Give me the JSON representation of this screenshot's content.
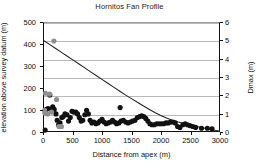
{
  "chart_data": {
    "type": "scatter",
    "title": "Hornitos Fan Profile",
    "xlabel": "Distance from apex (m)",
    "ylabel": "elevation above survey datum (m)",
    "y2label": "Dmax (m)",
    "xlim": [
      0,
      3000
    ],
    "ylim": [
      0,
      500
    ],
    "y2lim": [
      0,
      6
    ],
    "grid": true,
    "legend": "none",
    "xticks": [
      0,
      500,
      1000,
      1500,
      2000,
      2500,
      3000
    ],
    "yticks": [
      0,
      100,
      200,
      300,
      400,
      500
    ],
    "y2ticks": [
      0,
      1,
      2,
      3,
      4,
      5,
      6
    ],
    "series": [
      {
        "name": "fan surface profile",
        "type": "line",
        "axis": "left",
        "color": "#222222",
        "points": [
          [
            0,
            418
          ],
          [
            100,
            400
          ],
          [
            200,
            382
          ],
          [
            300,
            364
          ],
          [
            400,
            346
          ],
          [
            500,
            328
          ],
          [
            600,
            310
          ],
          [
            700,
            292
          ],
          [
            800,
            274
          ],
          [
            900,
            256
          ],
          [
            1000,
            238
          ],
          [
            1100,
            220
          ],
          [
            1200,
            202
          ],
          [
            1300,
            184
          ],
          [
            1400,
            166
          ],
          [
            1500,
            150
          ],
          [
            1600,
            133
          ],
          [
            1700,
            117
          ],
          [
            1800,
            101
          ],
          [
            1900,
            86
          ],
          [
            2000,
            72
          ],
          [
            2100,
            60
          ],
          [
            2200,
            50
          ],
          [
            2300,
            42
          ],
          [
            2400,
            35
          ],
          [
            2500,
            28
          ],
          [
            2600,
            22
          ],
          [
            2700,
            16
          ],
          [
            2800,
            10
          ],
          [
            2900,
            5
          ],
          [
            3000,
            0
          ]
        ]
      },
      {
        "name": "Dmax dark points",
        "type": "scatter",
        "axis": "right",
        "color": "#111111",
        "marker": "filled-circle",
        "points": [
          [
            20,
            0.05
          ],
          [
            40,
            1.2
          ],
          [
            70,
            1.25
          ],
          [
            100,
            2.0
          ],
          [
            130,
            1.2
          ],
          [
            150,
            1.35
          ],
          [
            175,
            1.2
          ],
          [
            205,
            0.95
          ],
          [
            225,
            0.6
          ],
          [
            250,
            0.35
          ],
          [
            275,
            0.45
          ],
          [
            305,
            0.75
          ],
          [
            330,
            0.8
          ],
          [
            360,
            0.95
          ],
          [
            395,
            0.9
          ],
          [
            420,
            0.55
          ],
          [
            450,
            0.75
          ],
          [
            480,
            1.1
          ],
          [
            510,
            1.05
          ],
          [
            545,
            1.05
          ],
          [
            575,
            0.95
          ],
          [
            605,
            0.75
          ],
          [
            635,
            0.55
          ],
          [
            665,
            0.6
          ],
          [
            700,
            0.9
          ],
          [
            730,
            1.15
          ],
          [
            760,
            0.95
          ],
          [
            790,
            0.6
          ],
          [
            820,
            0.45
          ],
          [
            855,
            0.5
          ],
          [
            890,
            0.4
          ],
          [
            925,
            0.45
          ],
          [
            960,
            0.55
          ],
          [
            995,
            0.65
          ],
          [
            1030,
            0.5
          ],
          [
            1065,
            0.4
          ],
          [
            1100,
            0.45
          ],
          [
            1140,
            0.5
          ],
          [
            1175,
            0.6
          ],
          [
            1210,
            0.5
          ],
          [
            1245,
            0.4
          ],
          [
            1285,
            0.45
          ],
          [
            1305,
            1.3
          ],
          [
            1320,
            0.55
          ],
          [
            1360,
            0.6
          ],
          [
            1400,
            0.5
          ],
          [
            1440,
            0.45
          ],
          [
            1480,
            0.5
          ],
          [
            1520,
            0.55
          ],
          [
            1560,
            0.6
          ],
          [
            1600,
            0.75
          ],
          [
            1640,
            0.8
          ],
          [
            1675,
            0.85
          ],
          [
            1710,
            0.8
          ],
          [
            1745,
            0.7
          ],
          [
            1780,
            0.55
          ],
          [
            1815,
            0.4
          ],
          [
            1850,
            0.35
          ],
          [
            1890,
            0.35
          ],
          [
            1930,
            0.4
          ],
          [
            1970,
            0.4
          ],
          [
            2010,
            0.4
          ],
          [
            2050,
            0.4
          ],
          [
            2090,
            0.45
          ],
          [
            2130,
            0.45
          ],
          [
            2170,
            0.5
          ],
          [
            2210,
            0.5
          ],
          [
            2250,
            0.45
          ],
          [
            2290,
            0.25
          ],
          [
            2330,
            0.2
          ],
          [
            2380,
            0.35
          ],
          [
            2420,
            0.4
          ],
          [
            2460,
            0.35
          ],
          [
            2500,
            0.3
          ],
          [
            2550,
            0.25
          ],
          [
            2600,
            0.2
          ],
          [
            2700,
            0.15
          ],
          [
            2800,
            0.15
          ],
          [
            2880,
            0.12
          ]
        ]
      },
      {
        "name": "Dmax gray points",
        "type": "scatter",
        "axis": "right",
        "color": "#8e8e8e",
        "marker": "filled-circle",
        "points": [
          [
            10,
            1.15
          ],
          [
            15,
            1.0
          ],
          [
            25,
            2.1
          ],
          [
            60,
            0.95
          ],
          [
            95,
            2.05
          ],
          [
            130,
            1.05
          ],
          [
            170,
            5.0
          ],
          [
            215,
            1.75
          ],
          [
            255,
            0.25
          ],
          [
            300,
            0.25
          ]
        ]
      }
    ]
  }
}
